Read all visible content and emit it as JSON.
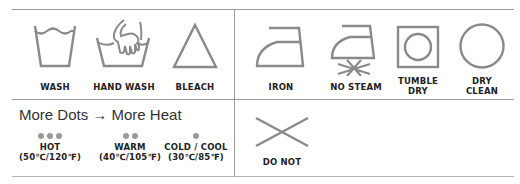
{
  "colors": {
    "icon_stroke": "#8a8a8a",
    "divider": "#9a9a9a",
    "label_text": "#222222",
    "dot": "#9a9a9a"
  },
  "care_symbols_top": [
    {
      "icon": "wash-tub-icon",
      "label": "WASH"
    },
    {
      "icon": "hand-wash-icon",
      "label": "HAND WASH"
    },
    {
      "icon": "bleach-triangle-icon",
      "label": "BLEACH"
    },
    {
      "icon": "iron-icon",
      "label": "IRON"
    },
    {
      "icon": "no-steam-iron-icon",
      "label": "NO STEAM"
    },
    {
      "icon": "tumble-dry-icon",
      "label_line1": "TUMBLE",
      "label_line2": "DRY"
    },
    {
      "icon": "dry-clean-circle-icon",
      "label_line1": "DRY",
      "label_line2": "CLEAN"
    }
  ],
  "heat_legend": {
    "title": "More Dots → More Heat",
    "levels": [
      {
        "dots": 3,
        "label": "HOT",
        "temp": "(50℃/120℉)"
      },
      {
        "dots": 2,
        "label": "WARM",
        "temp": "(40℃/105℉)"
      },
      {
        "dots": 1,
        "label": "COLD / COOL",
        "temp": "(30℃/85℉)"
      }
    ]
  },
  "do_not": {
    "icon": "cross-x-icon",
    "label": "DO NOT"
  }
}
